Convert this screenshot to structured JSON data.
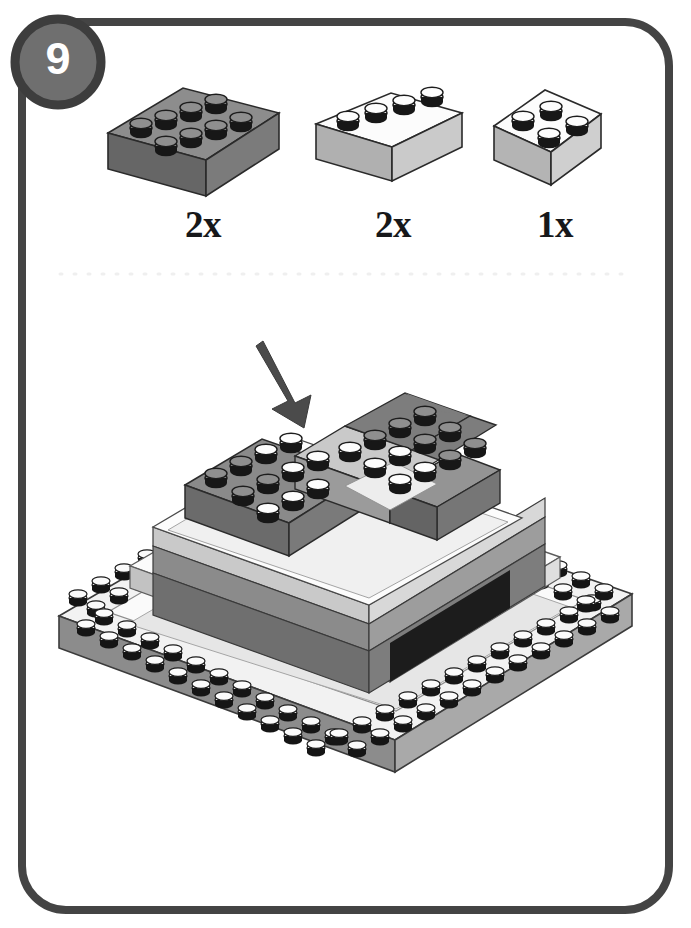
{
  "page": {
    "background_color": "#ffffff",
    "frame": {
      "name": "instruction-page-frame",
      "stroke_color": "#444444",
      "stroke_width": 8,
      "corner_radius": 44
    },
    "step_badge": {
      "number": "9",
      "fill_color": "#6f6f6f",
      "border_color": "#3d3d3d",
      "text_color": "#ffffff"
    },
    "divider": {
      "name": "dotted-divider",
      "color": "#f0f0f0",
      "style": "dotted"
    }
  },
  "parts_inventory": {
    "title": "",
    "items": [
      {
        "id": "brick-2x4-dark-gray",
        "quantity_label": "2x",
        "brick_type": "2x4",
        "color_name": "dark gray",
        "top_color": "#8d8d8d",
        "side_color": "#6b6b6b",
        "front_color": "#7d7d7d",
        "stud_color": "#9a9a9a"
      },
      {
        "id": "brick-1x4-light-gray",
        "quantity_label": "2x",
        "brick_type": "1x4",
        "color_name": "light gray",
        "top_color": "#fdfdfd",
        "side_color": "#a8a8a8",
        "front_color": "#bdbdbd",
        "stud_color": "#ffffff"
      },
      {
        "id": "brick-2x2-light-gray",
        "quantity_label": "1x",
        "brick_type": "2x2",
        "color_name": "light gray",
        "top_color": "#fdfdfd",
        "side_color": "#a8a8a8",
        "front_color": "#c4c4c4",
        "stud_color": "#ffffff"
      }
    ]
  },
  "assembly": {
    "name": "step-9-assembly",
    "arrow": {
      "name": "placement-arrow",
      "color": "#4a4a4a",
      "direction": "down-right"
    },
    "description": "Isometric layered base with gray top bricks, light gray bands, dark recess and studded baseplate border",
    "palette": {
      "dark_gray": "#6f6f6f",
      "mid_gray": "#8a8a8a",
      "light_gray": "#cfcfcf",
      "pale_gray": "#e9e9e9",
      "white": "#fbfbfb",
      "black_recess": "#1f1f1f",
      "stud_outline": "#1c1c1c"
    }
  }
}
